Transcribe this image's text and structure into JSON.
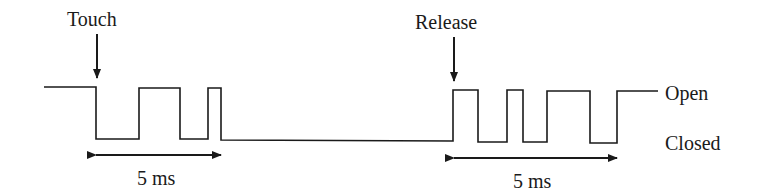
{
  "diagram": {
    "labels": {
      "touch": "Touch",
      "release": "Release",
      "open": "Open",
      "closed": "Closed",
      "touch_duration": "5 ms",
      "release_duration": "5 ms"
    },
    "states": [
      "Open",
      "Closed"
    ],
    "events": [
      {
        "name": "Touch",
        "bounce_duration": "5 ms",
        "transitions": 5
      },
      {
        "name": "Release",
        "bounce_duration": "5 ms",
        "transitions": 7
      }
    ],
    "colors": {
      "line": "#1a1a1a",
      "background": "#ffffff"
    }
  }
}
